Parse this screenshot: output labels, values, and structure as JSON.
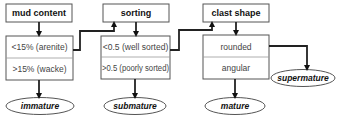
{
  "diagram": {
    "stages": [
      {
        "header": "mud content",
        "options": [
          "<15% (arenite)",
          ">15% (wacke)"
        ],
        "result": "immature"
      },
      {
        "header": "sorting",
        "options": [
          "<0.5 (well sorted)",
          ">0.5 (poorly sorted)"
        ],
        "result": "submature"
      },
      {
        "header": "clast shape",
        "options": [
          "rounded",
          "angular"
        ],
        "result": "mature"
      }
    ],
    "final_result": "supermature",
    "colors": {
      "box_border": "#555555",
      "arrow": "#222222",
      "text": "#111111",
      "cell_text": "#444444"
    }
  }
}
